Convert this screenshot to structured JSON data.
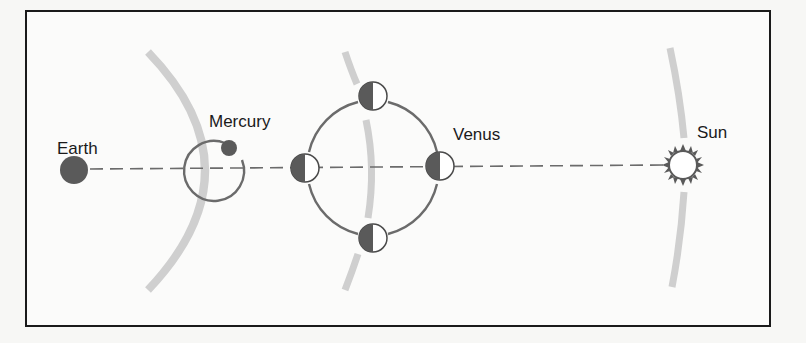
{
  "diagram": {
    "type": "planetary-phases-schematic",
    "labels": {
      "earth": "Earth",
      "mercury": "Mercury",
      "venus": "Venus",
      "sun": "Sun"
    },
    "bodies": [
      {
        "name": "Earth",
        "kind": "planet",
        "cx": 74,
        "cy": 170,
        "r": 14
      },
      {
        "name": "Mercury",
        "kind": "planet",
        "cx": 229,
        "cy": 148,
        "r": 8,
        "orbit": {
          "cx": 212,
          "cy": 170,
          "r": 30
        }
      },
      {
        "name": "Venus",
        "kind": "planet-phases",
        "orbit": {
          "cx": 373,
          "cy": 168,
          "r": 67
        },
        "phase_positions": [
          "top",
          "left",
          "right",
          "bottom"
        ]
      },
      {
        "name": "Sun",
        "kind": "star",
        "cx": 683,
        "cy": 165,
        "r": 14
      }
    ],
    "line_of_sight": {
      "from": "Earth",
      "to": "Sun",
      "style": "dashed"
    },
    "colors": {
      "planet_fill": "#5a5a5a",
      "orbit_stroke": "#6b6b6b",
      "arc_band": "#cfcfcf",
      "frame": "#1a1a1a",
      "background": "#fbfbfa"
    }
  }
}
